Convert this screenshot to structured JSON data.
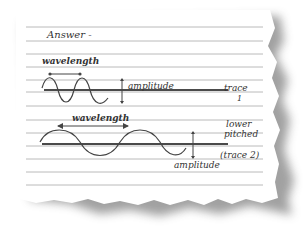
{
  "note": {
    "heading": "Answer -",
    "trace1": {
      "wavelength_label": "wavelength",
      "amplitude_label": "amplitude",
      "trace_label": "trace",
      "trace_number": "1"
    },
    "trace2": {
      "wavelength_label": "wavelength",
      "pitch_label_line1": "lower",
      "pitch_label_line2": "pitched",
      "trace_label": "(trace 2)",
      "amplitude_label": "amplitude"
    }
  },
  "colors": {
    "paper": "#ffffff",
    "rule_line": "#a8a8a8",
    "ink": "#333333",
    "baseline": "#4a4a4a",
    "shadow": "#555555"
  }
}
